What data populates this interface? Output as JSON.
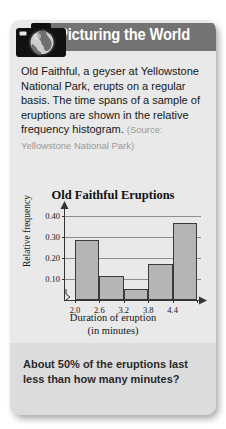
{
  "card": {
    "header": {
      "banner_title": "Picturing the World",
      "icon": "camera-globe-icon"
    },
    "paragraph": "Old Faithful, a geyser at Yellowstone National Park, erupts on a regular basis. The time spans of a sample of eruptions are shown in the relative frequency histogram.",
    "source": "(Source: Yellowstone National Park)",
    "question": "About 50% of the eruptions last less than how many minutes?"
  },
  "chart_data": {
    "type": "bar",
    "title": "Old Faithful Eruptions",
    "xlabel": "Duration of eruption",
    "xlabel_units": "(in minutes)",
    "ylabel": "Relative frequency",
    "categories": [
      "2.0-2.6",
      "2.6-3.2",
      "3.2-3.8",
      "3.8-4.4",
      "4.4-5.0"
    ],
    "bin_edges": [
      2.0,
      2.6,
      3.2,
      3.8,
      4.4,
      5.0
    ],
    "values": [
      0.285,
      0.115,
      0.055,
      0.17,
      0.37
    ],
    "xticks": [
      "2.0",
      "2.6",
      "3.2",
      "3.8",
      "4.4"
    ],
    "yticks": [
      "0.10",
      "0.20",
      "0.30",
      "0.40"
    ],
    "ytick_values": [
      0.1,
      0.2,
      0.3,
      0.4
    ],
    "ylim": [
      0,
      0.44
    ],
    "grid": true,
    "axis_break": true,
    "legend": "none",
    "bar_color": "#b5b5b5",
    "bar_edge_color": "#3a3a3a"
  },
  "colors": {
    "card_bg": "#e9e9e9",
    "banner_bg": "#737373",
    "question_bg": "#dcdcdc",
    "banner_text": "#ffffff"
  }
}
